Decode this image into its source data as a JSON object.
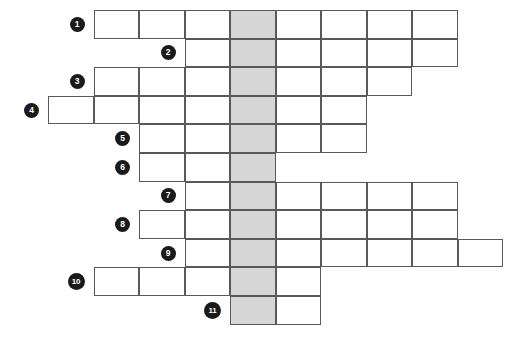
{
  "puzzle": {
    "title": "Crossword Puzzle Grid",
    "type": "crossword-grid",
    "highlight_color": "#d6d6d6",
    "grid_line_color": "#58595b",
    "cell_background": "#ffffff",
    "number_badge_color": "#1a1a1a",
    "number_text_color": "#ffffff",
    "cell_width": 45.5,
    "cell_height": 28.6,
    "origin_x": 48,
    "origin_y": 10,
    "highlight_column": 4,
    "total_rows": 11,
    "rows": [
      {
        "number": "1",
        "start_col": 1,
        "length": 8
      },
      {
        "number": "2",
        "start_col": 3,
        "length": 6
      },
      {
        "number": "3",
        "start_col": 1,
        "length": 7
      },
      {
        "number": "4",
        "start_col": 0,
        "length": 7
      },
      {
        "number": "5",
        "start_col": 2,
        "length": 5
      },
      {
        "number": "6",
        "start_col": 2,
        "length": 3
      },
      {
        "number": "7",
        "start_col": 3,
        "length": 6
      },
      {
        "number": "8",
        "start_col": 2,
        "length": 7
      },
      {
        "number": "9",
        "start_col": 3,
        "length": 7
      },
      {
        "number": "10",
        "start_col": 1,
        "length": 5
      },
      {
        "number": "11",
        "start_col": 4,
        "length": 2
      }
    ]
  }
}
